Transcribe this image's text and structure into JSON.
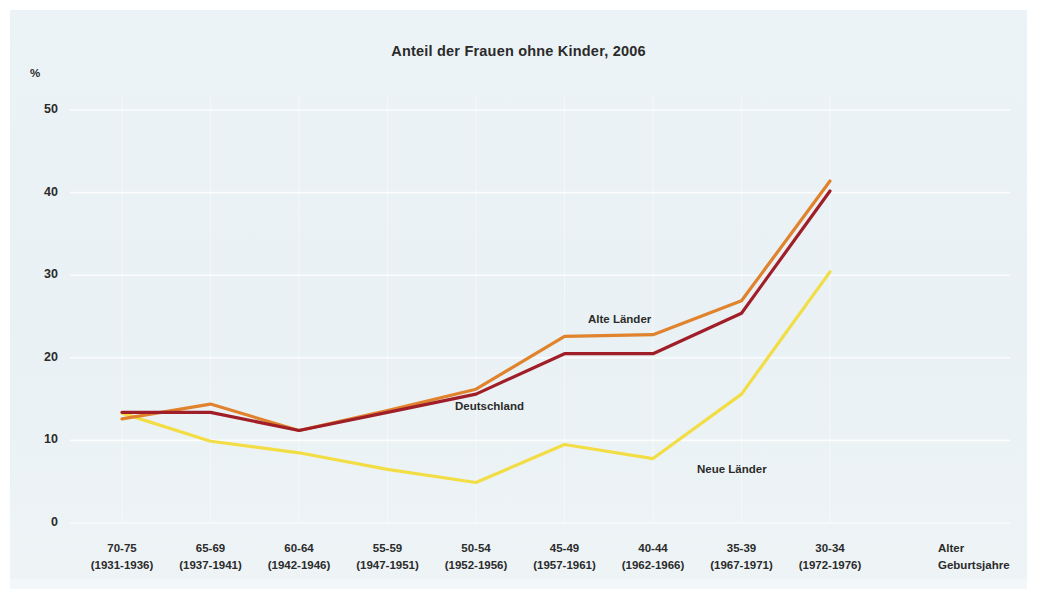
{
  "chart_data": {
    "type": "line",
    "title": "Anteil der Frauen ohne Kinder, 2006",
    "xlabel": "Alter",
    "xlabel2": "Geburtsjahre",
    "ylabel": "%",
    "ylim": [
      0,
      50
    ],
    "yticks": [
      "50",
      "40",
      "30",
      "20",
      "10",
      "0"
    ],
    "grid": true,
    "legend_position": "inline-annotations",
    "categories": [
      "70-75",
      "65-69",
      "60-64",
      "55-59",
      "50-54",
      "45-49",
      "40-44",
      "35-39",
      "30-34"
    ],
    "categories_years": [
      "(1931-1936)",
      "(1937-1941)",
      "(1942-1946)",
      "(1947-1951)",
      "(1952-1956)",
      "(1957-1961)",
      "(1962-1966)",
      "(1967-1971)",
      "(1972-1976)"
    ],
    "series": [
      {
        "name": "Alte Länder",
        "color": "#E0832C",
        "values": [
          12.6,
          14.4,
          11.2,
          13.6,
          16.2,
          22.6,
          22.8,
          26.9,
          41.4
        ]
      },
      {
        "name": "Deutschland",
        "color": "#A01E28",
        "values": [
          13.4,
          13.4,
          11.2,
          13.4,
          15.6,
          20.5,
          20.5,
          25.4,
          40.2
        ]
      },
      {
        "name": "Neue Länder",
        "color": "#F2DD45",
        "values": [
          13.3,
          9.9,
          8.5,
          6.5,
          4.9,
          9.5,
          7.8,
          15.6,
          30.4
        ]
      }
    ]
  },
  "axis_caption": {
    "line1": "Alter",
    "line2": "Geburtsjahre"
  }
}
